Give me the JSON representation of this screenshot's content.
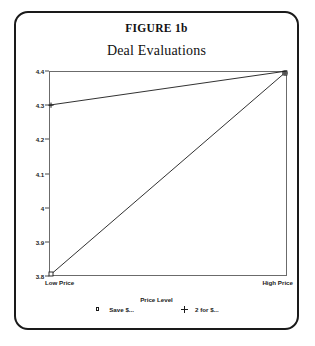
{
  "figure": {
    "label": "FIGURE 1b"
  },
  "chart_data": {
    "type": "line",
    "title": "Deal Evaluations",
    "xlabel": "Price Level",
    "ylabel": "",
    "categories": [
      "Low Price",
      "High Price"
    ],
    "ytick_labels": [
      "4.4",
      "4.3",
      "4.2",
      "4.1",
      "4",
      "3.9",
      "3.8"
    ],
    "yticks": [
      4.4,
      4.3,
      4.2,
      4.1,
      4.0,
      3.9,
      3.8
    ],
    "ylim": [
      3.8,
      4.4
    ],
    "grid": false,
    "legend_position": "bottom",
    "series": [
      {
        "name": "Save $...",
        "marker": "open-square",
        "values": [
          3.8,
          4.4
        ]
      },
      {
        "name": "2 for $...",
        "marker": "plus",
        "values": [
          4.3,
          4.4
        ]
      }
    ]
  }
}
